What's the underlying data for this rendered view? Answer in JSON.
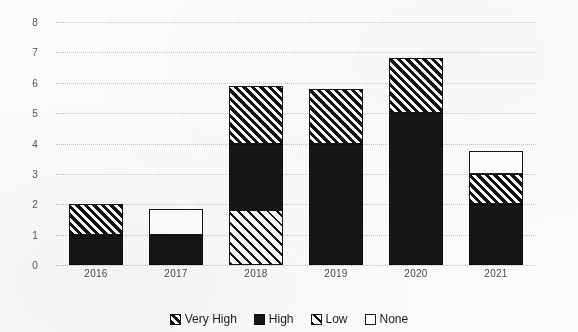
{
  "chart_data": {
    "type": "bar",
    "subtype": "stacked-bar",
    "title": "",
    "subtitle": "",
    "xlabel": "",
    "ylabel": "",
    "categories": [
      "2016",
      "2017",
      "2018",
      "2019",
      "2020",
      "2021"
    ],
    "ylim": [
      0,
      8
    ],
    "yticks": [
      0,
      1,
      2,
      3,
      4,
      5,
      6,
      7,
      8
    ],
    "ytick_labels": [
      "0",
      "1",
      "2",
      "3",
      "4",
      "5",
      "6",
      "7",
      "8"
    ],
    "grid": true,
    "grid_style": "dotted-horizontal",
    "legend_position": "bottom",
    "series": [
      {
        "name": "Very High",
        "pattern": "dense-diagonal-hatch",
        "color": "#111111",
        "values": [
          1.0,
          0.0,
          1.9,
          1.8,
          1.8,
          1.0
        ]
      },
      {
        "name": "High",
        "pattern": "solid-black",
        "color": "#161616",
        "values": [
          1.0,
          1.0,
          2.2,
          4.0,
          5.0,
          2.0
        ]
      },
      {
        "name": "Low",
        "pattern": "sparse-diagonal-hatch",
        "color": "#111111",
        "values": [
          0.0,
          0.0,
          1.8,
          0.0,
          0.0,
          0.0
        ]
      },
      {
        "name": "None",
        "pattern": "white-outline",
        "color": "#ffffff",
        "values": [
          0.0,
          0.85,
          0.0,
          0.0,
          0.0,
          0.75
        ]
      }
    ],
    "stack_order_bottom_to_top": [
      "Low",
      "High",
      "Very High",
      "None"
    ],
    "totals": [
      2.0,
      1.85,
      5.9,
      5.8,
      6.8,
      3.75
    ]
  },
  "legend": {
    "items": [
      {
        "label": "Very High",
        "swatch": "swatch-very-high"
      },
      {
        "label": "High",
        "swatch": "swatch-high"
      },
      {
        "label": "Low",
        "swatch": "swatch-low"
      },
      {
        "label": "None",
        "swatch": "swatch-none"
      }
    ]
  }
}
